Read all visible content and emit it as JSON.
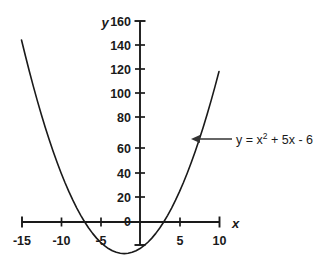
{
  "chart_data": {
    "type": "line",
    "title": "",
    "xlabel": "x",
    "ylabel": "y",
    "xlim": [
      -15,
      10
    ],
    "ylim": [
      -20,
      160
    ],
    "grid": false,
    "legend_position": "inline-annotation",
    "equation": "y = x² + 5x - 6",
    "equation_parts": {
      "lead": "y = x",
      "exponent": "2",
      "tail": "+ 5x - 6"
    },
    "annotations": [
      {
        "text": "y = x² + 5x - 6",
        "points_to_x": 6.6,
        "points_to_y": 65
      }
    ],
    "x_ticks": [
      -15,
      -10,
      -5,
      0,
      5,
      10
    ],
    "x_tick_labels": [
      "-15",
      "-10",
      "-5",
      "0",
      "5",
      "10"
    ],
    "y_ticks": [
      0,
      20,
      40,
      60,
      80,
      100,
      120,
      140,
      160
    ],
    "y_tick_labels": [
      "0",
      "20",
      "40",
      "60",
      "80",
      "100",
      "120",
      "140",
      "160"
    ],
    "series": [
      {
        "name": "y = x² + 5x - 6",
        "color": "#1a1a1a",
        "x": [
          -15.0,
          -14.5,
          -14.0,
          -13.5,
          -13.0,
          -12.5,
          -12.0,
          -11.5,
          -11.0,
          -10.5,
          -10.0,
          -9.5,
          -9.0,
          -8.5,
          -8.0,
          -7.5,
          -7.0,
          -6.5,
          -6.0,
          -5.5,
          -5.0,
          -4.5,
          -4.0,
          -3.5,
          -3.0,
          -2.5,
          -2.0,
          -1.5,
          -1.0,
          -0.5,
          0.0,
          0.5,
          1.0,
          1.5,
          2.0,
          2.5,
          3.0,
          3.5,
          4.0,
          4.5,
          5.0,
          5.5,
          6.0,
          6.5,
          7.0,
          7.5,
          8.0,
          8.5,
          9.0,
          9.5,
          10.0
        ],
        "y": [
          144.0,
          131.25,
          119.0,
          107.25,
          96.0,
          85.25,
          75.0,
          65.25,
          56.0,
          47.25,
          39.0,
          31.25,
          24.0,
          17.25,
          11.0,
          5.25,
          0.0,
          -4.75,
          -9.0,
          -12.75,
          -16.0,
          -18.75,
          -21.0,
          -22.75,
          -24.0,
          -24.75,
          -25.0,
          -24.75,
          -24.0,
          -22.75,
          -21.0,
          -18.75,
          -16.0,
          -12.75,
          -9.0,
          -4.75,
          0.0,
          5.25,
          11.0,
          17.25,
          24.0,
          31.25,
          39.0,
          47.25,
          56.0,
          65.25,
          75.0,
          85.25,
          96.0,
          107.25,
          119.0
        ],
        "vertex": {
          "x": -2.5,
          "y": -24.75
        },
        "roots": [
          -6,
          1
        ]
      }
    ]
  },
  "axes": {
    "y_axis_name": "y",
    "x_axis_name": "x"
  },
  "colors": {
    "background": "#ffffff",
    "curve": "#1a1a1a",
    "axis": "#1a1a1a",
    "text": "#1a1a1a",
    "annotation_arrow": "#333333"
  }
}
